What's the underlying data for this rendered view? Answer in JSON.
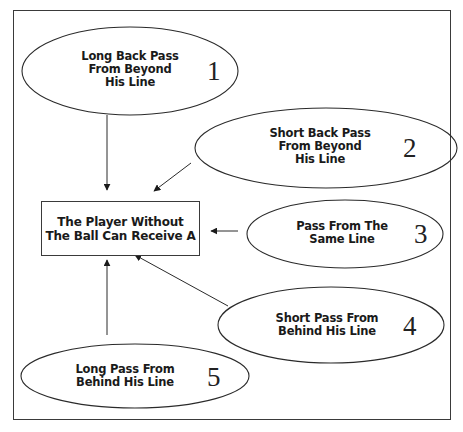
{
  "diagram": {
    "center": {
      "text": "The Player Without\nThe Ball Can Receive A"
    },
    "nodes": [
      {
        "id": 1,
        "number": "1",
        "text": "Long Back Pass\nFrom Beyond\nHis Line"
      },
      {
        "id": 2,
        "number": "2",
        "text": "Short Back Pass\nFrom Beyond\nHis Line"
      },
      {
        "id": 3,
        "number": "3",
        "text": "Pass From The\nSame Line"
      },
      {
        "id": 4,
        "number": "4",
        "text": "Short Pass From\nBehind His Line"
      },
      {
        "id": 5,
        "number": "5",
        "text": "Long Pass From\nBehind His Line"
      }
    ],
    "edges": [
      {
        "from": 1,
        "to": "center"
      },
      {
        "from": 2,
        "to": "center"
      },
      {
        "from": 3,
        "to": "center"
      },
      {
        "from": 4,
        "to": "center"
      },
      {
        "from": 5,
        "to": "center"
      }
    ],
    "colors": {
      "stroke": "#2a2a2a",
      "background": "#ffffff"
    }
  }
}
